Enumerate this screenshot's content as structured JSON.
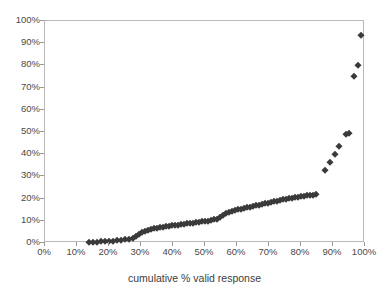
{
  "chart_data": {
    "type": "scatter",
    "title": "",
    "xlabel": "cumulative % valid response",
    "ylabel": "",
    "xlim": [
      0,
      100
    ],
    "ylim": [
      0,
      100
    ],
    "grid": false,
    "legend": "none",
    "marker": "diamond",
    "marker_color": "#3a3a3a",
    "x_tick_labels": [
      "0%",
      "10%",
      "20%",
      "30%",
      "40%",
      "50%",
      "60%",
      "70%",
      "80%",
      "90%",
      "100%"
    ],
    "x_ticks": [
      0,
      10,
      20,
      30,
      40,
      50,
      60,
      70,
      80,
      90,
      100
    ],
    "y_tick_labels": [
      "0%",
      "10%",
      "20%",
      "30%",
      "40%",
      "50%",
      "60%",
      "70%",
      "80%",
      "90%",
      "100%"
    ],
    "y_ticks": [
      0,
      10,
      20,
      30,
      40,
      50,
      60,
      70,
      80,
      90,
      100
    ],
    "series": [
      {
        "name": "cumulative response",
        "points": [
          [
            13.6,
            0.4
          ],
          [
            15.0,
            0.5
          ],
          [
            16.3,
            0.6
          ],
          [
            17.5,
            0.7
          ],
          [
            18.8,
            0.8
          ],
          [
            20.0,
            0.9
          ],
          [
            21.2,
            1.1
          ],
          [
            22.5,
            1.2
          ],
          [
            23.8,
            1.4
          ],
          [
            25.0,
            1.6
          ],
          [
            26.2,
            1.9
          ],
          [
            27.5,
            2.4
          ],
          [
            28.4,
            3.2
          ],
          [
            29.4,
            4.2
          ],
          [
            30.3,
            5.0
          ],
          [
            31.2,
            5.6
          ],
          [
            32.2,
            6.0
          ],
          [
            33.1,
            6.3
          ],
          [
            34.1,
            6.6
          ],
          [
            35.0,
            6.9
          ],
          [
            36.0,
            7.1
          ],
          [
            36.9,
            7.3
          ],
          [
            37.8,
            7.5
          ],
          [
            38.8,
            7.7
          ],
          [
            39.7,
            7.9
          ],
          [
            40.6,
            8.1
          ],
          [
            41.6,
            8.2
          ],
          [
            42.5,
            8.4
          ],
          [
            43.4,
            8.6
          ],
          [
            44.4,
            8.8
          ],
          [
            45.3,
            9.0
          ],
          [
            46.3,
            9.2
          ],
          [
            47.2,
            9.3
          ],
          [
            48.1,
            9.5
          ],
          [
            49.1,
            9.7
          ],
          [
            50.0,
            9.9
          ],
          [
            50.9,
            10.1
          ],
          [
            51.9,
            10.3
          ],
          [
            52.8,
            10.6
          ],
          [
            53.8,
            11.0
          ],
          [
            54.7,
            11.6
          ],
          [
            55.6,
            12.4
          ],
          [
            56.6,
            13.3
          ],
          [
            57.5,
            14.0
          ],
          [
            58.4,
            14.5
          ],
          [
            59.4,
            14.9
          ],
          [
            60.3,
            15.2
          ],
          [
            61.2,
            15.5
          ],
          [
            62.2,
            15.8
          ],
          [
            63.1,
            16.1
          ],
          [
            64.1,
            16.4
          ],
          [
            65.0,
            16.7
          ],
          [
            65.9,
            17.0
          ],
          [
            66.9,
            17.3
          ],
          [
            67.8,
            17.6
          ],
          [
            68.8,
            17.9
          ],
          [
            69.7,
            18.2
          ],
          [
            70.6,
            18.5
          ],
          [
            71.6,
            18.8
          ],
          [
            72.5,
            19.1
          ],
          [
            73.4,
            19.4
          ],
          [
            74.4,
            19.6
          ],
          [
            75.3,
            19.9
          ],
          [
            76.2,
            20.1
          ],
          [
            77.2,
            20.4
          ],
          [
            78.1,
            20.6
          ],
          [
            79.1,
            20.8
          ],
          [
            80.0,
            21.0
          ],
          [
            80.9,
            21.2
          ],
          [
            81.9,
            21.4
          ],
          [
            82.8,
            21.6
          ],
          [
            83.8,
            21.8
          ],
          [
            84.7,
            22.0
          ],
          [
            87.5,
            32.9
          ],
          [
            89.1,
            36.3
          ],
          [
            90.6,
            40.2
          ],
          [
            91.9,
            43.8
          ],
          [
            94.1,
            48.9
          ],
          [
            95.0,
            49.4
          ],
          [
            96.6,
            75.2
          ],
          [
            97.8,
            80.3
          ],
          [
            98.8,
            93.6
          ]
        ]
      }
    ]
  }
}
